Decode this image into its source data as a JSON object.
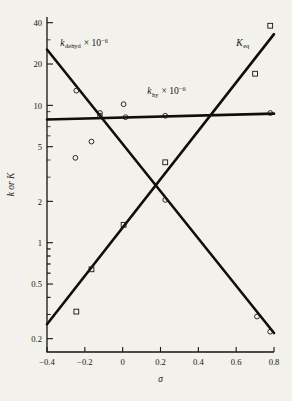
{
  "chart_data": {
    "type": "line",
    "title": "",
    "subtitle": "",
    "xlabel": "σ",
    "ylabel": "k or K",
    "y_scale": "log",
    "x_scale": "linear",
    "xlim": [
      -0.4,
      0.8
    ],
    "ylim": [
      0.16,
      44
    ],
    "grid": false,
    "legend_position": "inline-annotations",
    "xticks": [
      -0.4,
      -0.2,
      0,
      0.2,
      0.4,
      0.6,
      0.8
    ],
    "xticklabels": [
      "-0.4",
      "-0.2",
      "0",
      "0.2",
      "0.4",
      "0.6",
      "0.8"
    ],
    "yticks": [
      0.2,
      0.5,
      1,
      2,
      5,
      10,
      20,
      40
    ],
    "yticklabels": [
      "0.2",
      "0.5",
      "1",
      "2",
      "5",
      "10",
      "20",
      "40"
    ],
    "series": [
      {
        "name": "k_dehyd_x_10^-6",
        "label_main": "k",
        "label_sub": "dehyd",
        "label_rest": " × 10",
        "label_sup": "−6",
        "marker": "circle",
        "line_from": [
          -0.4,
          25.5
        ],
        "line_to": [
          0.8,
          0.22
        ],
        "points": [
          {
            "x": -0.25,
            "y": 4.15
          },
          {
            "x": -0.245,
            "y": 12.8
          },
          {
            "x": -0.165,
            "y": 5.45
          },
          {
            "x": -0.12,
            "y": 8.8
          },
          {
            "x": 0.005,
            "y": 10.2
          },
          {
            "x": 0.225,
            "y": 2.05
          },
          {
            "x": 0.71,
            "y": 0.29
          },
          {
            "x": 0.78,
            "y": 0.225
          }
        ]
      },
      {
        "name": "k_hy_x_10^-6",
        "label_main": "k",
        "label_sub": "hy",
        "label_rest": " × 10",
        "label_sup": "−6",
        "marker": "circle",
        "line_from": [
          -0.4,
          7.9
        ],
        "line_to": [
          0.8,
          8.7
        ],
        "points": [
          {
            "x": -0.12,
            "y": 8.4
          },
          {
            "x": 0.015,
            "y": 8.2
          },
          {
            "x": 0.225,
            "y": 8.4
          },
          {
            "x": 0.78,
            "y": 8.8
          }
        ]
      },
      {
        "name": "K_eq",
        "label_main": "K",
        "label_sub": "eq",
        "label_rest": "",
        "label_sup": "",
        "marker": "square",
        "line_from": [
          -0.4,
          0.255
        ],
        "line_to": [
          0.8,
          33.0
        ],
        "points": [
          {
            "x": -0.245,
            "y": 0.315
          },
          {
            "x": -0.165,
            "y": 0.64
          },
          {
            "x": 0.005,
            "y": 1.35
          },
          {
            "x": 0.225,
            "y": 3.85
          },
          {
            "x": 0.7,
            "y": 17.0
          },
          {
            "x": 0.78,
            "y": 38.0
          }
        ]
      }
    ],
    "annotations": [
      {
        "name": "k-dehyd-annotation",
        "x": -0.33,
        "y": 27.0
      },
      {
        "name": "k-hy-annotation",
        "x": 0.13,
        "y": 12.0
      },
      {
        "name": "k-eq-annotation",
        "x": 0.6,
        "y": 27.0
      }
    ],
    "colors": {
      "ink": "#17150f",
      "background": "#f3f1ec"
    }
  }
}
